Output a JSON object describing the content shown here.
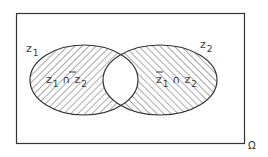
{
  "diagram": {
    "type": "venn",
    "universe_label": "Ω",
    "sets": [
      {
        "name": "z",
        "subscript": "1"
      },
      {
        "name": "z",
        "subscript": "2"
      }
    ],
    "regions": [
      {
        "id": "z1_and_not_z2",
        "parts": [
          "z",
          "1",
          "∩",
          "z",
          "2"
        ],
        "negated": [
          false,
          true
        ],
        "hatch": "backslash"
      },
      {
        "id": "not_z1_and_z2",
        "parts": [
          "z",
          "1",
          "∩",
          "z",
          "2"
        ],
        "negated": [
          true,
          false
        ],
        "hatch": "slash"
      }
    ],
    "colors": {
      "stroke": "#333333",
      "hatch": "#555555",
      "background": "#ffffff",
      "text": "#3a3a3a"
    }
  }
}
